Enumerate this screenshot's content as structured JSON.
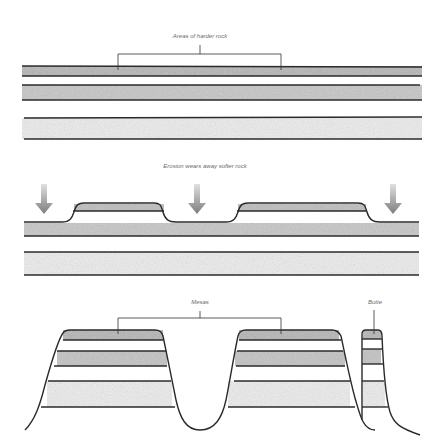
{
  "diagram": {
    "panels": [
      {
        "id": "stage-1",
        "label": "Areas of harder rock",
        "description": "Horizontal sedimentary rock layers; hard caprock layer on top"
      },
      {
        "id": "stage-2",
        "label": "Erosion wears away softer rock",
        "arrows": 3,
        "description": "Downward arrows show erosion; remaining hard rock forms raised plateaus"
      },
      {
        "id": "stage-3",
        "labels": [
          "Mesas",
          "Butte"
        ],
        "description": "Two wide flat-topped mesas and one narrow butte remain"
      }
    ],
    "colors": {
      "line": "#2a2a2a",
      "hard_rock_fill": "#b9b9b9",
      "medium_rock_fill": "#d2d2d2",
      "soft_rock_fill": "#ececec",
      "arrow": "#8a8a8a",
      "label": "#6a6a6a"
    }
  }
}
